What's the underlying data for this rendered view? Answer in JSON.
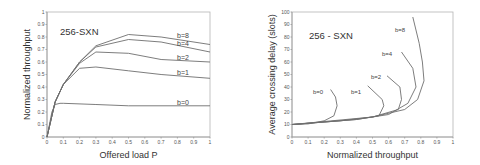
{
  "chart_data": [
    {
      "type": "line",
      "title": "256-SXN",
      "xlabel": "Offered load P",
      "ylabel": "Normalized throughput",
      "xlim": [
        0,
        1
      ],
      "ylim": [
        0,
        1
      ],
      "xticks": [
        "0",
        "0.1",
        "0.2",
        "0.3",
        "0.4",
        "0.5",
        "0.6",
        "0.7",
        "0.8",
        "0.9",
        "1"
      ],
      "yticks": [
        "0",
        "0.1",
        "0.2",
        "0.3",
        "0.4",
        "0.5",
        "0.6",
        "0.7",
        "0.8",
        "0.9",
        "1"
      ],
      "grid": false,
      "series": [
        {
          "name": "b=8",
          "x": [
            0,
            0.05,
            0.1,
            0.2,
            0.3,
            0.5,
            0.7,
            1.0
          ],
          "y": [
            0,
            0.28,
            0.42,
            0.6,
            0.73,
            0.82,
            0.8,
            0.74
          ]
        },
        {
          "name": "b=4",
          "x": [
            0,
            0.05,
            0.1,
            0.2,
            0.3,
            0.5,
            0.7,
            1.0
          ],
          "y": [
            0,
            0.28,
            0.42,
            0.6,
            0.72,
            0.78,
            0.76,
            0.68
          ]
        },
        {
          "name": "b=2",
          "x": [
            0,
            0.05,
            0.1,
            0.2,
            0.3,
            0.5,
            0.7,
            1.0
          ],
          "y": [
            0,
            0.28,
            0.42,
            0.59,
            0.68,
            0.67,
            0.62,
            0.6
          ]
        },
        {
          "name": "b=1",
          "x": [
            0,
            0.05,
            0.1,
            0.2,
            0.3,
            0.5,
            0.7,
            1.0
          ],
          "y": [
            0,
            0.28,
            0.42,
            0.55,
            0.56,
            0.53,
            0.5,
            0.47
          ]
        },
        {
          "name": "b=0",
          "x": [
            0,
            0.03,
            0.05,
            0.08,
            0.1,
            0.3,
            0.5,
            1.0
          ],
          "y": [
            0,
            0.2,
            0.26,
            0.27,
            0.27,
            0.26,
            0.25,
            0.25
          ]
        }
      ]
    },
    {
      "type": "line",
      "title": "256 - SXN",
      "xlabel": "Normalized throughput",
      "ylabel": "Average crossing delay (slots)",
      "xlim": [
        0,
        1
      ],
      "ylim": [
        0,
        100
      ],
      "xticks": [
        "0",
        "0.1",
        "0.2",
        "0.3",
        "0.4",
        "0.5",
        "0.6",
        "0.7",
        "0.8",
        "0.9",
        "1"
      ],
      "yticks": [
        "0",
        "10",
        "20",
        "30",
        "40",
        "50",
        "60",
        "70",
        "80",
        "90",
        "100"
      ],
      "grid": false,
      "series": [
        {
          "name": "b=0",
          "x": [
            0,
            0.1,
            0.2,
            0.26,
            0.28,
            0.27,
            0.24
          ],
          "y": [
            10,
            10.5,
            13,
            17,
            25,
            32,
            38
          ]
        },
        {
          "name": "b=1",
          "x": [
            0,
            0.2,
            0.4,
            0.54,
            0.57,
            0.56,
            0.47
          ],
          "y": [
            10,
            12,
            14,
            17,
            25,
            30,
            41
          ]
        },
        {
          "name": "b=2",
          "x": [
            0,
            0.3,
            0.5,
            0.66,
            0.68,
            0.67,
            0.59
          ],
          "y": [
            10,
            13,
            16,
            22,
            30,
            40,
            49
          ]
        },
        {
          "name": "b=4",
          "x": [
            0,
            0.4,
            0.6,
            0.72,
            0.77,
            0.75,
            0.68
          ],
          "y": [
            10,
            14,
            18,
            27,
            40,
            55,
            68
          ]
        },
        {
          "name": "b=8",
          "x": [
            0,
            0.5,
            0.7,
            0.78,
            0.82,
            0.81,
            0.79,
            0.75
          ],
          "y": [
            10,
            16,
            22,
            30,
            45,
            60,
            75,
            96
          ]
        }
      ]
    }
  ],
  "left_chart": {
    "title": "256-SXN",
    "xlabel": "Offered load P",
    "ylabel": "Normalized throughput",
    "labels": [
      "b=8",
      "b=4",
      "b=2",
      "b=1",
      "b=0"
    ]
  },
  "right_chart": {
    "title": "256 - SXN",
    "xlabel": "Normalized throughput",
    "ylabel": "Average crossing delay (slots)",
    "labels": [
      "b=0",
      "b=1",
      "b=2",
      "b=4",
      "b=8"
    ]
  }
}
